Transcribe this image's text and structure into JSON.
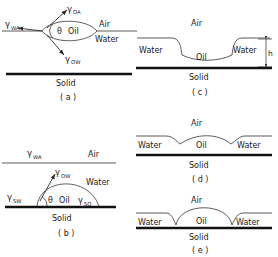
{
  "figure": {
    "phases": {
      "air": "Air",
      "water": "Water",
      "oil": "Oil",
      "solid": "Solid"
    },
    "symbols": {
      "gamma": "γ",
      "theta": "θ",
      "sub_OA": "OA",
      "sub_OW": "OW",
      "sub_WA": "WA",
      "sub_SW": "SW",
      "sub_SO": "SO",
      "height": "h"
    },
    "panels": [
      {
        "id": "a",
        "caption": "( a )",
        "description": "oil lens floating at water-air interface with three interfacial tension vectors",
        "labels": {
          "air": "Air",
          "water": "Water",
          "oil": "Oil",
          "solid": "Solid",
          "angle": "θ",
          "gamma_oa": "γ",
          "gamma_oa_sub": "OA",
          "gamma_ow": "γ",
          "gamma_ow_sub": "OW",
          "gamma_wa": "γ",
          "gamma_wa_sub": "WA"
        }
      },
      {
        "id": "b",
        "caption": "( b )",
        "description": "oil drop resting on solid under water with contact angle",
        "labels": {
          "air": "Air",
          "water": "Water",
          "oil": "Oil",
          "solid": "Solid",
          "angle": "θ",
          "gamma_wa": "γ",
          "gamma_wa_sub": "WA",
          "gamma_ow": "γ",
          "gamma_ow_sub": "OW",
          "gamma_sw": "γ",
          "gamma_sw_sub": "SW",
          "gamma_so": "γ",
          "gamma_so_sub": "SO"
        }
      },
      {
        "id": "c",
        "caption": "( c )",
        "description": "thin oil film of thickness h between two water bodies on solid",
        "labels": {
          "air": "Air",
          "water_left": "Water",
          "water_right": "Water",
          "oil": "Oil",
          "solid": "Solid",
          "height": "h"
        }
      },
      {
        "id": "d",
        "caption": "( d )",
        "description": "wide flattened oil lens between water bodies on solid",
        "labels": {
          "air": "Air",
          "water_left": "Water",
          "water_right": "Water",
          "oil": "Oil",
          "solid": "Solid"
        }
      },
      {
        "id": "e",
        "caption": "( e )",
        "description": "tall hemispherical oil drop between water bodies on solid",
        "labels": {
          "air": "Air",
          "water_left": "Water",
          "water_right": "Water",
          "oil": "Oil",
          "solid": "Solid"
        }
      }
    ]
  },
  "colors": {
    "ink": "#1a1a1a",
    "solid_line": "#111111",
    "interface": "#4a4a4a",
    "background": "#ffffff"
  }
}
